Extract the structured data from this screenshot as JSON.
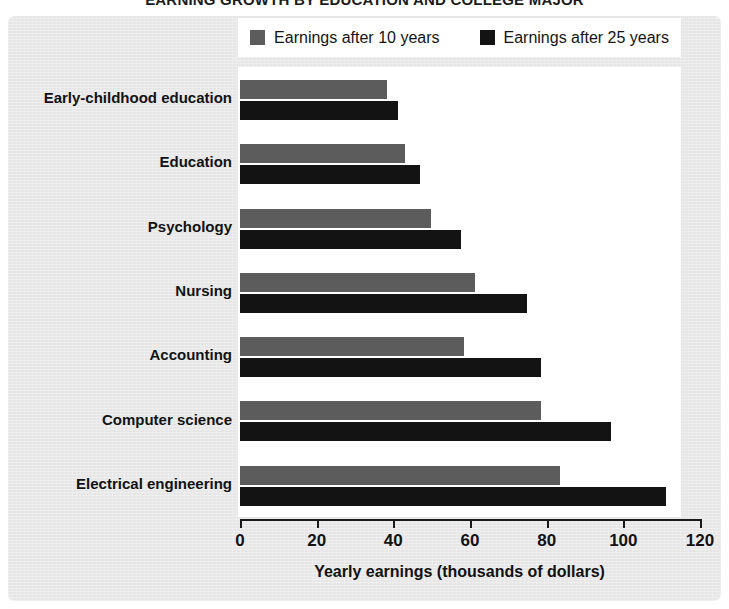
{
  "chart_data": {
    "type": "bar",
    "orientation": "horizontal",
    "title": "EARNING GROWTH BY EDUCATION AND COLLEGE MAJOR",
    "xlabel": "Yearly earnings (thousands of dollars)",
    "ylabel": "",
    "xlim": [
      0,
      120
    ],
    "xticks": [
      0,
      20,
      40,
      60,
      80,
      100,
      120
    ],
    "xticklabels": [
      "0",
      "20",
      "40",
      "60",
      "80",
      "100",
      "120"
    ],
    "grid": false,
    "legend_position": "top",
    "categories": [
      "Early-childhood education",
      "Education",
      "Psychology",
      "Nursing",
      "Accounting",
      "Computer science",
      "Electrical engineering"
    ],
    "series": [
      {
        "name": "Earnings after 10 years",
        "color": "#5c5c5c",
        "values": [
          40,
          45,
          52,
          64,
          61,
          82,
          87
        ]
      },
      {
        "name": "Earnings after 25 years",
        "color": "#131313",
        "values": [
          43,
          49,
          60,
          78,
          82,
          101,
          116
        ]
      }
    ]
  },
  "colors": {
    "series_10_years": "#5c5c5c",
    "series_25_years": "#131313",
    "panel_background": "#e6e6e6",
    "plot_background": "#ffffff",
    "axis": "#1a1a1a"
  }
}
